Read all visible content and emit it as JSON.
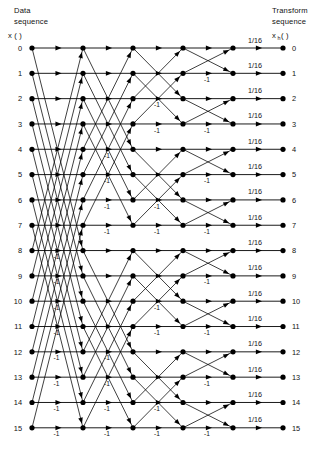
{
  "figure": {
    "width": 334,
    "height": 459,
    "background": "#ffffff",
    "ink": "#000000"
  },
  "header": {
    "left_line1": "Data",
    "left_line2": "sequence",
    "left_symbol": "x (   )",
    "right_line1": "Transform",
    "right_line2": "sequence",
    "right_symbol_base": "x",
    "right_symbol_sub": "h",
    "right_symbol_tail": "(   )"
  },
  "input_indices": [
    "0",
    "1",
    "2",
    "3",
    "4",
    "5",
    "6",
    "7",
    "8",
    "9",
    "10",
    "11",
    "12",
    "13",
    "14",
    "15"
  ],
  "output_indices": [
    "0",
    "1",
    "2",
    "3",
    "4",
    "5",
    "6",
    "7",
    "8",
    "9",
    "10",
    "11",
    "12",
    "13",
    "14",
    "15"
  ],
  "scale_labels": [
    "1/16",
    "1/16",
    "1/16",
    "1/16",
    "1/16",
    "1/16",
    "1/16",
    "1/16",
    "1/16",
    "1/16",
    "1/16",
    "1/16",
    "1/16",
    "1/16",
    "1/16",
    "1/16"
  ],
  "negative_label": "-1",
  "geometry": {
    "col_x": [
      32,
      83,
      133,
      183,
      233,
      283
    ],
    "row_y0": 48,
    "row_dy": 25.32,
    "rows": 16,
    "node_r": 2.6,
    "input_label_x": 22,
    "output_label_x": 292,
    "scale_label_dx": 22,
    "scale_label_dy": -5.5
  },
  "chart_data": {
    "type": "diagram",
    "subtype": "butterfly-signal-flow-graph",
    "n_points": 16,
    "n_stages": 4,
    "stage_spans": [
      8,
      4,
      2,
      1
    ],
    "final_scale": "1/16",
    "stages": [
      {
        "index": 0,
        "span": 8,
        "from_col": 0,
        "to_col": 1,
        "negative_rows": [
          8,
          9,
          10,
          11,
          12,
          13,
          14,
          15
        ]
      },
      {
        "index": 1,
        "span": 4,
        "from_col": 1,
        "to_col": 2,
        "negative_rows": [
          4,
          5,
          6,
          7,
          12,
          13,
          14,
          15
        ]
      },
      {
        "index": 2,
        "span": 2,
        "from_col": 2,
        "to_col": 3,
        "negative_rows": [
          2,
          3,
          6,
          7,
          10,
          11,
          14,
          15
        ]
      },
      {
        "index": 3,
        "span": 1,
        "from_col": 3,
        "to_col": 4,
        "negative_rows": [
          1,
          3,
          5,
          7,
          9,
          11,
          13,
          15
        ]
      }
    ],
    "output_stage": {
      "from_col": 4,
      "to_col": 5,
      "gain": "1/16"
    }
  }
}
